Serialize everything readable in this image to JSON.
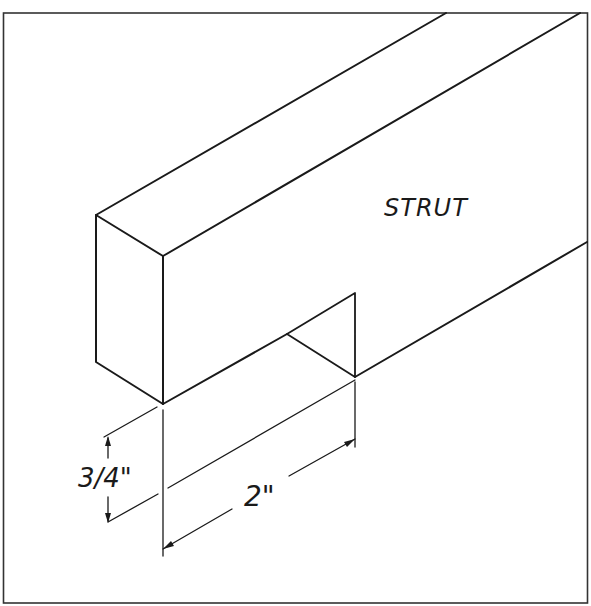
{
  "figure": {
    "part_label": "STRUT",
    "dimensions": {
      "depth": "3/4\"",
      "width": "2\""
    },
    "colors": {
      "line": "#1a1a1a",
      "background": "#ffffff"
    }
  }
}
